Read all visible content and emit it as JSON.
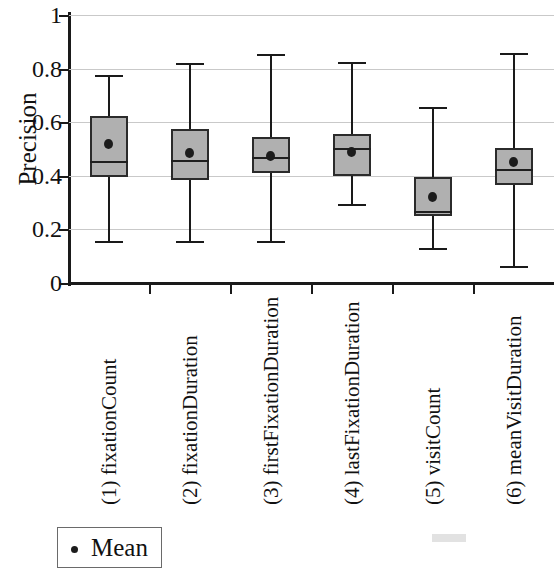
{
  "chart_data": {
    "type": "box",
    "title": "",
    "xlabel": "",
    "ylabel": "Precision",
    "ylim": [
      0,
      1
    ],
    "yticks": [
      0,
      0.2,
      0.4,
      0.6,
      0.8,
      1
    ],
    "ytick_labels": [
      "0",
      "0.2",
      "0.4",
      "0.6",
      "0.8",
      "1"
    ],
    "grid": true,
    "legend": {
      "position": "bottom-left",
      "entries": [
        {
          "label": "Mean",
          "marker": "dot",
          "color": "#1c1c1c"
        }
      ]
    },
    "categories": [
      "(1) fixationCount",
      "(2) fixationDuration",
      "(3) firstFixationDuration",
      "(4) lastFixationDuration",
      "(5) visitCount",
      "(6) meanVisitDuration"
    ],
    "boxes": [
      {
        "category": "(1) fixationCount",
        "whisker_low": 0.155,
        "q1": 0.395,
        "median": 0.455,
        "q3": 0.625,
        "whisker_high": 0.775,
        "mean": 0.52
      },
      {
        "category": "(2) fixationDuration",
        "whisker_low": 0.155,
        "q1": 0.385,
        "median": 0.46,
        "q3": 0.575,
        "whisker_high": 0.82,
        "mean": 0.485
      },
      {
        "category": "(3) firstFixationDuration",
        "whisker_low": 0.155,
        "q1": 0.41,
        "median": 0.47,
        "q3": 0.545,
        "whisker_high": 0.855,
        "mean": 0.475
      },
      {
        "category": "(4) lastFixationDuration",
        "whisker_low": 0.295,
        "q1": 0.4,
        "median": 0.505,
        "q3": 0.555,
        "whisker_high": 0.825,
        "mean": 0.49
      },
      {
        "category": "(5) visitCount",
        "whisker_low": 0.13,
        "q1": 0.25,
        "median": 0.27,
        "q3": 0.395,
        "whisker_high": 0.655,
        "mean": 0.32
      },
      {
        "category": "(6) meanVisitDuration",
        "whisker_low": 0.065,
        "q1": 0.365,
        "median": 0.425,
        "q3": 0.505,
        "whisker_high": 0.86,
        "mean": 0.45
      }
    ],
    "colors": {
      "box_fill": "#b0b0b0",
      "box_edge": "#2b2b2b",
      "mean_marker": "#1c1c1c",
      "grid": "#c9c9c9",
      "axis": "#1a1a1a"
    }
  },
  "legend": {
    "mean_label": "Mean"
  }
}
